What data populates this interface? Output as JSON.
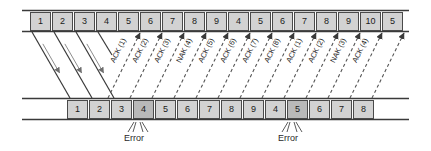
{
  "diagram": {
    "colors": {
      "box_fill": "#d2d2d2",
      "box_fill_error": "#b9b9b9",
      "box_stroke": "#4a4a4a",
      "line": "#3a3a3a",
      "dashed_line": "#555555",
      "text": "#1a1a1a"
    },
    "sender": {
      "label": "sender-timeline",
      "frames": [
        {
          "id": "s0",
          "text": "1",
          "x": 30,
          "error": false
        },
        {
          "id": "s1",
          "text": "2",
          "x": 52,
          "error": false
        },
        {
          "id": "s2",
          "text": "3",
          "x": 74,
          "error": false
        },
        {
          "id": "s3",
          "text": "4",
          "x": 96,
          "error": false
        },
        {
          "id": "s4",
          "text": "5",
          "x": 118,
          "error": false
        },
        {
          "id": "s5",
          "text": "6",
          "x": 140,
          "error": false
        },
        {
          "id": "s6",
          "text": "7",
          "x": 162,
          "error": false
        },
        {
          "id": "s7",
          "text": "8",
          "x": 184,
          "error": false
        },
        {
          "id": "s8",
          "text": "9",
          "x": 206,
          "error": false
        },
        {
          "id": "s9",
          "text": "4",
          "x": 228,
          "error": false
        },
        {
          "id": "s10",
          "text": "5",
          "x": 250,
          "error": false
        },
        {
          "id": "s11",
          "text": "6",
          "x": 272,
          "error": false
        },
        {
          "id": "s12",
          "text": "7",
          "x": 294,
          "error": false
        },
        {
          "id": "s13",
          "text": "8",
          "x": 316,
          "error": false
        },
        {
          "id": "s14",
          "text": "9",
          "x": 338,
          "error": false
        },
        {
          "id": "s15",
          "text": "10",
          "x": 360,
          "error": false
        },
        {
          "id": "s16",
          "text": "5",
          "x": 382,
          "error": false
        }
      ]
    },
    "receiver": {
      "label": "receiver-timeline",
      "frames": [
        {
          "id": "r0",
          "text": "1",
          "x": 67,
          "error": false
        },
        {
          "id": "r1",
          "text": "2",
          "x": 89,
          "error": false
        },
        {
          "id": "r2",
          "text": "3",
          "x": 111,
          "error": false
        },
        {
          "id": "r3",
          "text": "4",
          "x": 133,
          "error": true
        },
        {
          "id": "r4",
          "text": "5",
          "x": 155,
          "error": false
        },
        {
          "id": "r5",
          "text": "6",
          "x": 177,
          "error": false
        },
        {
          "id": "r6",
          "text": "7",
          "x": 199,
          "error": false
        },
        {
          "id": "r7",
          "text": "8",
          "x": 221,
          "error": false
        },
        {
          "id": "r8",
          "text": "9",
          "x": 243,
          "error": false
        },
        {
          "id": "r9",
          "text": "4",
          "x": 265,
          "error": false
        },
        {
          "id": "r10",
          "text": "5",
          "x": 287,
          "error": true
        },
        {
          "id": "r11",
          "text": "6",
          "x": 309,
          "error": false
        },
        {
          "id": "r12",
          "text": "7",
          "x": 331,
          "error": false
        },
        {
          "id": "r13",
          "text": "8",
          "x": 353,
          "error": false
        }
      ]
    },
    "ack_arrows": [
      {
        "id": "a0",
        "text": "ACK (1)",
        "x0": 108,
        "x1": 140
      },
      {
        "id": "a1",
        "text": "ACK (2)",
        "x0": 130,
        "x1": 162
      },
      {
        "id": "a2",
        "text": "ACK (3)",
        "x0": 152,
        "x1": 184
      },
      {
        "id": "a3",
        "text": "NAK (4)",
        "x0": 174,
        "x1": 206
      },
      {
        "id": "a4",
        "text": "ACK (5)",
        "x0": 196,
        "x1": 228
      },
      {
        "id": "a5",
        "text": "ACK (6)",
        "x0": 218,
        "x1": 250
      },
      {
        "id": "a6",
        "text": "ACK (7)",
        "x0": 240,
        "x1": 272
      },
      {
        "id": "a7",
        "text": "ACK (8)",
        "x0": 262,
        "x1": 294
      },
      {
        "id": "a8",
        "text": "ACK (1)",
        "x0": 284,
        "x1": 316
      },
      {
        "id": "a9",
        "text": "ACK (2)",
        "x0": 306,
        "x1": 338
      },
      {
        "id": "a10",
        "text": "NAK (3)",
        "x0": 328,
        "x1": 360
      },
      {
        "id": "a11",
        "text": "ACK (4)",
        "x0": 350,
        "x1": 382
      }
    ],
    "data_arrows": [
      {
        "id": "d0",
        "x0": 32,
        "x1": 70
      },
      {
        "id": "d1",
        "x0": 54,
        "x1": 92
      },
      {
        "id": "d2",
        "x0": 76,
        "x1": 114
      },
      {
        "id": "d3",
        "x0": 98,
        "x1": 112
      }
    ],
    "trailing_arrows": [
      {
        "id": "t0",
        "x0": 372,
        "x1": 404
      }
    ],
    "errors": [
      {
        "id": "e0",
        "text": "Error",
        "x": 124,
        "label_x": 124
      },
      {
        "id": "e1",
        "text": "Error",
        "x": 278,
        "label_x": 278
      }
    ]
  }
}
